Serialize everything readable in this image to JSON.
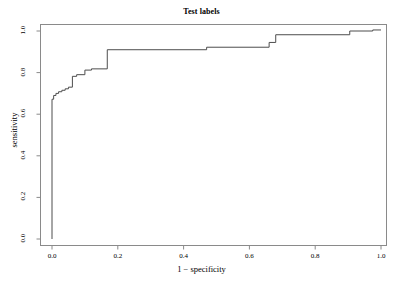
{
  "chart_data": {
    "type": "line",
    "title": "Test labels",
    "xlabel": "1 − specificity",
    "ylabel": "sensitivity",
    "xlim": [
      0.0,
      1.0
    ],
    "ylim": [
      0.0,
      1.0
    ],
    "grid": false,
    "legend": null,
    "xticks": [
      0.0,
      0.2,
      0.4,
      0.6,
      0.8,
      1.0
    ],
    "xtick_labels": [
      "0.0",
      "0.2",
      "0.4",
      "0.6",
      "0.8",
      "1.0"
    ],
    "yticks": [
      0.0,
      0.2,
      0.4,
      0.6,
      0.8,
      1.0
    ],
    "ytick_labels": [
      "0.0",
      "0.2",
      "0.4",
      "0.6",
      "0.8",
      "1.0"
    ],
    "series": [
      {
        "name": "ROC curve",
        "color": "#4d4d4d",
        "x": [
          0.0,
          0.0,
          0.005,
          0.005,
          0.012,
          0.012,
          0.02,
          0.02,
          0.03,
          0.03,
          0.04,
          0.04,
          0.05,
          0.05,
          0.062,
          0.062,
          0.075,
          0.075,
          0.1,
          0.1,
          0.12,
          0.12,
          0.168,
          0.168,
          0.47,
          0.47,
          0.66,
          0.66,
          0.68,
          0.68,
          0.905,
          0.905,
          0.975,
          0.975,
          1.0
        ],
        "y": [
          0.0,
          0.672,
          0.672,
          0.69,
          0.69,
          0.7,
          0.7,
          0.708,
          0.708,
          0.715,
          0.715,
          0.722,
          0.722,
          0.73,
          0.73,
          0.782,
          0.782,
          0.79,
          0.79,
          0.812,
          0.812,
          0.818,
          0.818,
          0.91,
          0.91,
          0.922,
          0.922,
          0.945,
          0.945,
          0.982,
          0.982,
          1.0,
          1.0,
          1.005,
          1.005
        ]
      }
    ]
  },
  "axis_titles": {
    "x": "1 − specificity",
    "y": "sensitivity"
  },
  "title": "Test labels",
  "colors": {
    "curve": "#4d4d4d",
    "frame": "#808080",
    "text": "#1a1a1a",
    "background": "#ffffff"
  }
}
